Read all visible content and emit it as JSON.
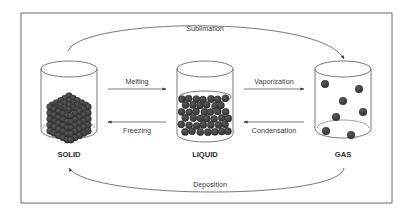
{
  "diagram": {
    "states": [
      {
        "id": "solid",
        "label": "SOLID",
        "particle_arrangement": "packed-cube"
      },
      {
        "id": "liquid",
        "label": "LIQUID",
        "particle_arrangement": "close-random"
      },
      {
        "id": "gas",
        "label": "GAS",
        "particle_arrangement": "sparse"
      }
    ],
    "transitions": [
      {
        "id": "melting",
        "label": "Melting",
        "from": "solid",
        "to": "liquid"
      },
      {
        "id": "freezing",
        "label": "Freezing",
        "from": "liquid",
        "to": "solid"
      },
      {
        "id": "vaporization",
        "label": "Vaporization",
        "from": "liquid",
        "to": "gas"
      },
      {
        "id": "condensation",
        "label": "Condensation",
        "from": "gas",
        "to": "liquid"
      },
      {
        "id": "sublimation",
        "label": "Sublimation",
        "from": "solid",
        "to": "gas"
      },
      {
        "id": "deposition",
        "label": "Deposition",
        "from": "gas",
        "to": "solid"
      }
    ],
    "colors": {
      "particle": "#3b3b3b",
      "outline": "#555555",
      "frame": "#6a6a6a",
      "text": "#3a3a3a"
    }
  }
}
